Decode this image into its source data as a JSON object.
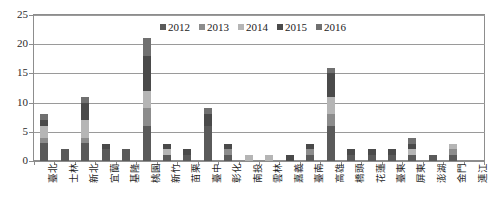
{
  "chart_data": {
    "type": "bar",
    "subtype": "stacked-bar",
    "title": "",
    "xlabel": "",
    "ylabel": "",
    "ylim": [
      0,
      25
    ],
    "yticks": [
      0,
      5,
      10,
      15,
      20,
      25
    ],
    "grid": true,
    "legend_position": "top-center",
    "categories": [
      "臺北",
      "士林",
      "新北",
      "宜蘭",
      "基隆",
      "桃園",
      "新竹",
      "苗栗",
      "臺中",
      "彰化",
      "南投",
      "雲林",
      "嘉義",
      "臺南",
      "高雄",
      "橋頭",
      "花蓮",
      "臺東",
      "屏東",
      "澎湖",
      "金門",
      "連江"
    ],
    "series": [
      {
        "name": "2012",
        "color": "#5a5a5a",
        "values": [
          3,
          2,
          3,
          2,
          2,
          6,
          1,
          1,
          6,
          1,
          0,
          0,
          0,
          1,
          6,
          1,
          1,
          1,
          1,
          1,
          1,
          0
        ]
      },
      {
        "name": "2013",
        "color": "#8c8c8c",
        "values": [
          1,
          0,
          1,
          0,
          0,
          3,
          0,
          0,
          0,
          1,
          0,
          0,
          0,
          1,
          2,
          0,
          0,
          0,
          0,
          0,
          1,
          0
        ]
      },
      {
        "name": "2014",
        "color": "#b5b5b5",
        "values": [
          2,
          0,
          3,
          0,
          0,
          3,
          1,
          0,
          0,
          0,
          1,
          1,
          0,
          0,
          3,
          0,
          0,
          0,
          1,
          0,
          1,
          0
        ]
      },
      {
        "name": "2015",
        "color": "#4a4a4a",
        "values": [
          1,
          0,
          3,
          1,
          0,
          6,
          1,
          1,
          2,
          1,
          0,
          0,
          1,
          1,
          4,
          1,
          1,
          1,
          1,
          0,
          0,
          0
        ]
      },
      {
        "name": "2016",
        "color": "#707070",
        "values": [
          1,
          0,
          1,
          0,
          0,
          3,
          0,
          0,
          1,
          0,
          0,
          0,
          0,
          0,
          1,
          0,
          0,
          0,
          1,
          0,
          0,
          0
        ]
      }
    ],
    "totals": [
      8,
      2,
      11,
      3,
      2,
      21,
      3,
      2,
      9,
      3,
      1,
      1,
      1,
      3,
      16,
      2,
      2,
      2,
      4,
      1,
      3,
      0
    ]
  },
  "legend": {
    "items": [
      {
        "label": "2012",
        "color": "#5a5a5a"
      },
      {
        "label": "2013",
        "color": "#8c8c8c"
      },
      {
        "label": "2014",
        "color": "#b5b5b5"
      },
      {
        "label": "2015",
        "color": "#4a4a4a"
      },
      {
        "label": "2016",
        "color": "#707070"
      }
    ]
  },
  "axis": {
    "y_tick_labels": [
      "25",
      "20",
      "15",
      "10",
      "5",
      "0"
    ]
  }
}
